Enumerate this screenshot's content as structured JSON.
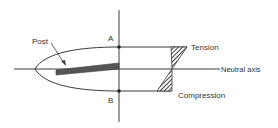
{
  "diagram": {
    "labels": {
      "post": "Post",
      "a": "A",
      "b": "B",
      "tension": "Tension",
      "compression": "Compression",
      "neutral_axis": "Neutral axis"
    },
    "colors": {
      "line": "#3a3a3a",
      "post": "#555555",
      "hatch": "#444444",
      "background": "#ffffff"
    }
  }
}
